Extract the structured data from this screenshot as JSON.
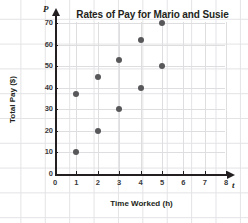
{
  "chart_data": {
    "type": "scatter",
    "title": "Rates of Pay for Mario and Susie",
    "xlabel": "Time Worked (h)",
    "ylabel": "Total Pay ($)",
    "x_axis_variable": "t",
    "y_axis_variable": "P",
    "xlim": [
      0,
      8
    ],
    "ylim": [
      0,
      70
    ],
    "xticks": [
      0,
      1,
      2,
      3,
      4,
      5,
      6,
      7,
      8
    ],
    "yticks": [
      0,
      10,
      20,
      30,
      40,
      50,
      60,
      70
    ],
    "grid": true,
    "legend": "none",
    "marker_color": "#58585b",
    "axis_color": "#231f20",
    "grid_color": "#dedee1",
    "series": [
      {
        "name": "Mario",
        "x": [
          1,
          2,
          3,
          4,
          5
        ],
        "values": [
          10,
          20,
          30,
          40,
          50
        ]
      },
      {
        "name": "Susie",
        "x": [
          1,
          2,
          3,
          4,
          5
        ],
        "values": [
          37,
          45,
          53,
          62,
          70
        ]
      }
    ]
  }
}
